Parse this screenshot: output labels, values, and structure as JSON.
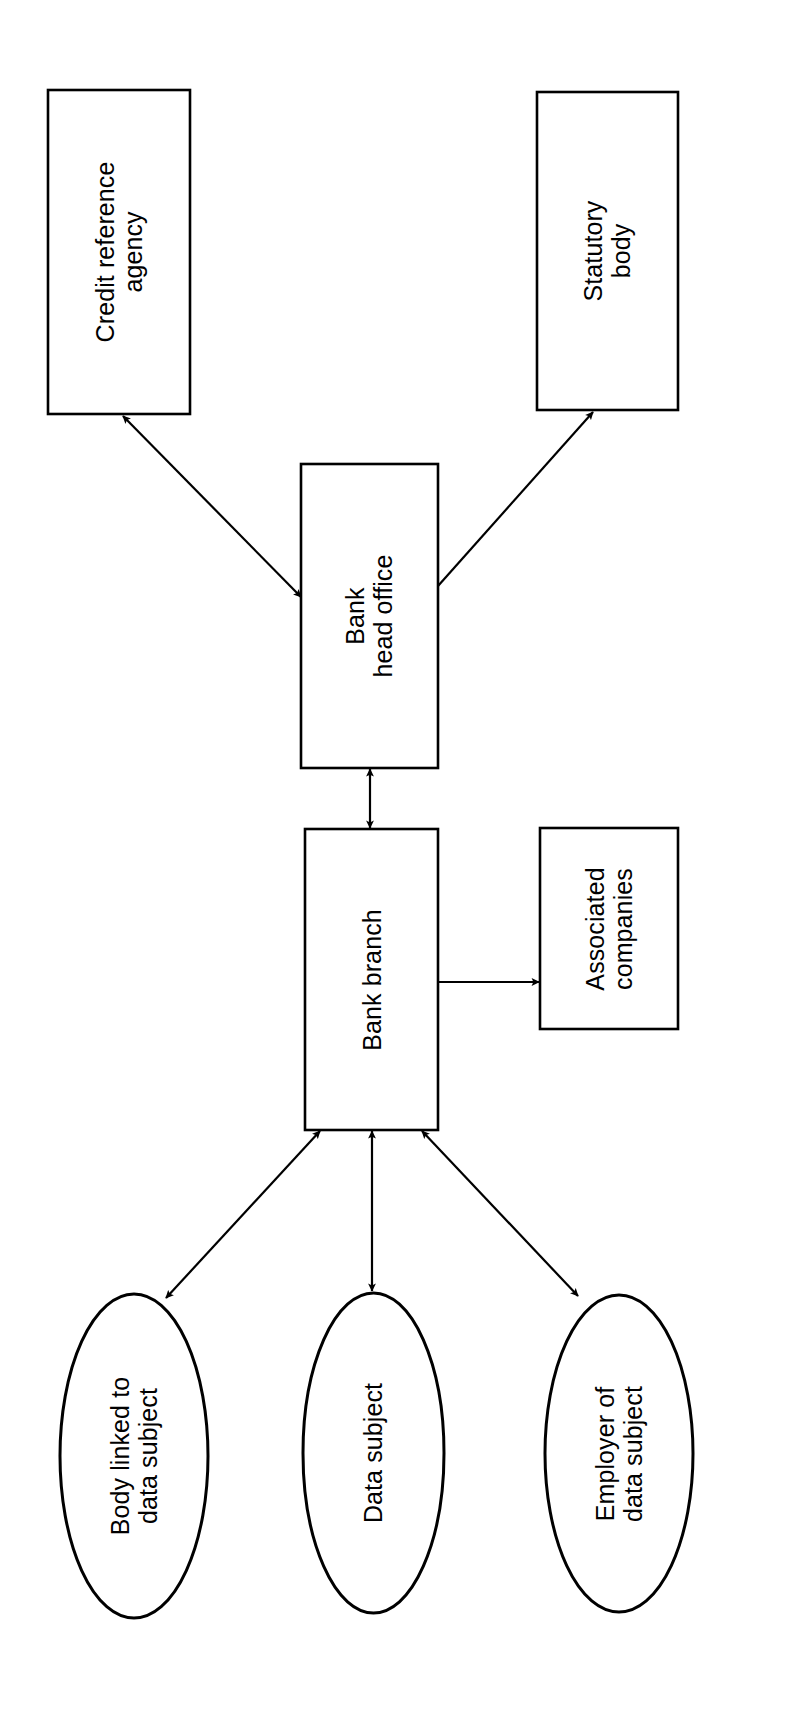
{
  "diagram": {
    "orientation": "rotated-90",
    "stroke_color": "#000000",
    "fill_color": "#ffffff",
    "background_color": "#ffffff",
    "nodes": [
      {
        "id": "credit-reference-agency",
        "shape": "rectangle",
        "label": "Credit reference\nagency",
        "x": 48,
        "y": 90,
        "w": 142,
        "h": 324
      },
      {
        "id": "statutory-body",
        "shape": "rectangle",
        "label": "Statutory\nbody",
        "x": 537,
        "y": 92,
        "w": 141,
        "h": 318
      },
      {
        "id": "bank-head-office",
        "shape": "rectangle",
        "label": "Bank\nhead office",
        "x": 301,
        "y": 464,
        "w": 137,
        "h": 304
      },
      {
        "id": "bank-branch",
        "shape": "rectangle",
        "label": "Bank branch",
        "x": 305,
        "y": 829,
        "w": 133,
        "h": 301
      },
      {
        "id": "associated-companies",
        "shape": "rectangle",
        "label": "Associated\ncompanies",
        "x": 540,
        "y": 828,
        "w": 138,
        "h": 201
      },
      {
        "id": "body-linked-to-data-subject",
        "shape": "ellipse",
        "label": "Body linked to\ndata subject",
        "x": 60,
        "y": 1294,
        "w": 148,
        "h": 324
      },
      {
        "id": "data-subject",
        "shape": "ellipse",
        "label": "Data subject",
        "x": 303,
        "y": 1293,
        "w": 141,
        "h": 320
      },
      {
        "id": "employer-of-data-subject",
        "shape": "ellipse",
        "label": "Employer of\ndata subject",
        "x": 545,
        "y": 1295,
        "w": 148,
        "h": 317
      }
    ],
    "edges": [
      {
        "id": "edge-head-office-credit-reference-agency",
        "from": "bank-head-office",
        "to": "credit-reference-agency",
        "arrowheads": "both",
        "x1": 301,
        "y1": 597,
        "x2": 123,
        "y2": 416
      },
      {
        "id": "edge-head-office-statutory-body",
        "from": "bank-head-office",
        "to": "statutory-body",
        "arrowheads": "end",
        "x1": 438,
        "y1": 586,
        "x2": 593,
        "y2": 412
      },
      {
        "id": "edge-head-office-bank-branch",
        "from": "bank-head-office",
        "to": "bank-branch",
        "arrowheads": "both",
        "x1": 370,
        "y1": 769,
        "x2": 370,
        "y2": 828
      },
      {
        "id": "edge-bank-branch-associated-companies",
        "from": "bank-branch",
        "to": "associated-companies",
        "arrowheads": "end",
        "x1": 439,
        "y1": 982,
        "x2": 539,
        "y2": 982
      },
      {
        "id": "edge-bank-branch-body-linked",
        "from": "bank-branch",
        "to": "body-linked-to-data-subject",
        "arrowheads": "both",
        "x1": 320,
        "y1": 1131,
        "x2": 166,
        "y2": 1298
      },
      {
        "id": "edge-bank-branch-data-subject",
        "from": "bank-branch",
        "to": "data-subject",
        "arrowheads": "both",
        "x1": 372,
        "y1": 1131,
        "x2": 372,
        "y2": 1291
      },
      {
        "id": "edge-bank-branch-employer",
        "from": "bank-branch",
        "to": "employer-of-data-subject",
        "arrowheads": "both",
        "x1": 422,
        "y1": 1131,
        "x2": 578,
        "y2": 1296
      }
    ]
  }
}
